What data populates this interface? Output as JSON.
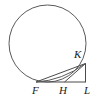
{
  "figure": {
    "type": "geometry-diagram",
    "width": 100,
    "height": 106,
    "background_color": "#ffffff",
    "stroke_color": "#4a4a4a",
    "label_color": "#1a1a1a",
    "stroke_width": 1
  },
  "circle": {
    "name": "circle",
    "center_x": 47.5,
    "center_y": 43.5,
    "radius": 38.5,
    "left": 9,
    "right": 86,
    "top": 5,
    "bottom": 82
  },
  "points": {
    "F": {
      "label": "F",
      "x": 36,
      "y": 82,
      "label_x": 32,
      "label_y": 85
    },
    "H": {
      "label": "H",
      "x": 65,
      "y": 82,
      "label_x": 59,
      "label_y": 85
    },
    "L": {
      "label": "L",
      "x": 85,
      "y": 82,
      "label_x": 84,
      "label_y": 85
    },
    "K": {
      "label": "K",
      "x": 85,
      "y": 64,
      "label_x": 74,
      "label_y": 49
    }
  },
  "segments": [
    {
      "name": "segment-FL",
      "from": "F",
      "to": "L",
      "x1": 36,
      "y1": 82,
      "x2": 85,
      "y2": 82
    },
    {
      "name": "segment-FK",
      "from": "F",
      "to": "K",
      "x1": 36,
      "y1": 82,
      "x2": 85,
      "y2": 64
    },
    {
      "name": "segment-HK",
      "from": "H",
      "to": "K",
      "x1": 65,
      "y1": 82,
      "x2": 85,
      "y2": 64
    },
    {
      "name": "segment-KL",
      "from": "K",
      "to": "L",
      "x1": 85,
      "y1": 64,
      "x2": 85,
      "y2": 82
    }
  ],
  "arc_FK": {
    "name": "arc-FK",
    "description": "minor arc of the circle from F to K",
    "from": "F",
    "to": "K"
  },
  "labels": {
    "F": "F",
    "H": "H",
    "L": "L",
    "K": "K"
  }
}
